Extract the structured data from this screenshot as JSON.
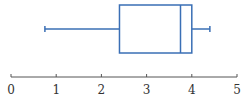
{
  "chart_data": {
    "type": "boxplot",
    "title": "",
    "xlabel": "",
    "ylabel": "",
    "orientation": "horizontal",
    "xlim": [
      0,
      5
    ],
    "ticks": [
      0,
      1,
      2,
      3,
      4,
      5
    ],
    "tick_labels": [
      "0",
      "1",
      "2",
      "3",
      "4",
      "5"
    ],
    "grid": false,
    "series": [
      {
        "name": "",
        "min": 0.75,
        "q1": 2.4,
        "median": 3.75,
        "q3": 4.0,
        "max": 4.4
      }
    ]
  },
  "colors": {
    "box": "#3a6fb5",
    "axis": "#555555",
    "text": "#333333"
  }
}
